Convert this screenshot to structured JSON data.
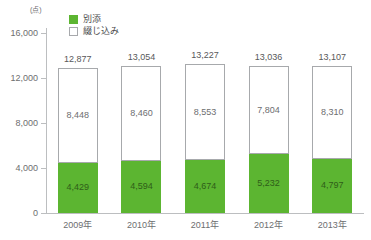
{
  "chart_data": {
    "type": "bar",
    "title": "",
    "subtitle": "",
    "xlabel": "",
    "ylabel": "",
    "unit_label": "(点)",
    "stacked": true,
    "grid": false,
    "legend_position": "top-left",
    "categories": [
      "2009年",
      "2010年",
      "2011年",
      "2012年",
      "2013年"
    ],
    "ylim": [
      0,
      16000
    ],
    "ytick_values": [
      0,
      4000,
      8000,
      12000,
      16000
    ],
    "ytick_labels": [
      "0",
      "4,000",
      "8,000",
      "12,000",
      "16,000"
    ],
    "series": [
      {
        "name": "別添",
        "color": "#5cb531",
        "values": [
          4429,
          4594,
          4674,
          5232,
          4797
        ],
        "labels": [
          "4,429",
          "4,594",
          "4,674",
          "5,232",
          "4,797"
        ]
      },
      {
        "name": "綴じ込み",
        "color": "#ffffff",
        "values": [
          8448,
          8460,
          8553,
          7804,
          8310
        ],
        "labels": [
          "8,448",
          "8,460",
          "8,553",
          "7,804",
          "8,310"
        ]
      }
    ],
    "totals": [
      12877,
      13054,
      13227,
      13036,
      13107
    ],
    "total_labels": [
      "12,877",
      "13,054",
      "13,227",
      "13,036",
      "13,107"
    ]
  },
  "legend": {
    "items": [
      {
        "label": "別添",
        "swatch": "green-filled-square"
      },
      {
        "label": "綴じ込み",
        "swatch": "white-outlined-square"
      }
    ]
  },
  "colors": {
    "series_green": "#5cb531",
    "series_white": "#ffffff",
    "outline": "#a7a9ac",
    "axis": "#bcbec0",
    "text": "#6d6e70",
    "background": "#ffffff"
  }
}
